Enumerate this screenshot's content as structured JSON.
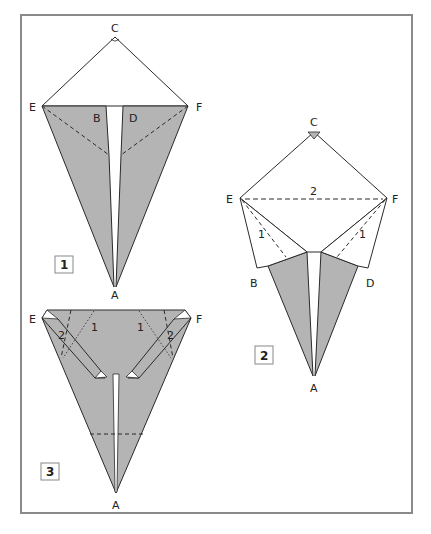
{
  "colors": {
    "paper_gray": "#b4b4b4",
    "line": "#2a2a2a",
    "frame": "#8a8a8a",
    "background": "#ffffff"
  },
  "steps": [
    {
      "number": "1",
      "labels": {
        "C": "C",
        "E": "E",
        "F": "F",
        "B": "B",
        "D": "D",
        "A": "A"
      }
    },
    {
      "number": "2",
      "labels": {
        "C": "C",
        "E": "E",
        "F": "F",
        "B": "B",
        "D": "D",
        "A": "A"
      },
      "fold_marks": [
        "2",
        "1",
        "1"
      ]
    },
    {
      "number": "3",
      "labels": {
        "E": "E",
        "F": "F",
        "A": "A"
      },
      "fold_marks": [
        "1",
        "1",
        "2",
        "2"
      ]
    }
  ]
}
